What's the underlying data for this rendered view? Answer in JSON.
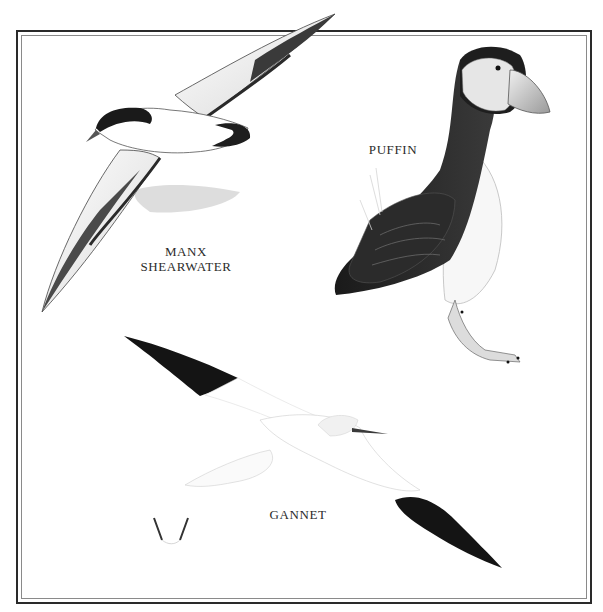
{
  "plate": {
    "birds": [
      {
        "name": "manx-shearwater",
        "label_lines": [
          "MANX",
          "SHEARWATER"
        ]
      },
      {
        "name": "puffin",
        "label_lines": [
          "PUFFIN"
        ]
      },
      {
        "name": "gannet",
        "label_lines": [
          "GANNET"
        ]
      }
    ]
  },
  "colors": {
    "frame_outer": "#2a2a2a",
    "frame_inner": "#8a8a8a",
    "ink_dark": "#1c1c1c",
    "label": "#2b2b2b",
    "background": "#ffffff"
  }
}
